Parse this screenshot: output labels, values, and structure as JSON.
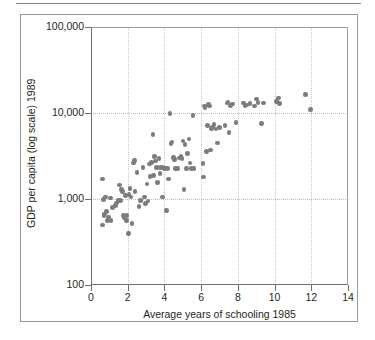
{
  "figure": {
    "outer_border_color": "#9a9a9a",
    "top_rule_color": "#8a8a8a",
    "background": "#ffffff"
  },
  "chart_data": {
    "type": "scatter",
    "title": "",
    "xlabel": "Average years of schooling 1985",
    "ylabel": "GDP per capita (log scale) 1989",
    "xlim": [
      0,
      14
    ],
    "ylim": [
      100,
      100000
    ],
    "yscale": "log",
    "xticks": [
      0,
      2,
      4,
      6,
      8,
      10,
      12,
      14
    ],
    "xticklabels": [
      "0",
      "2",
      "4",
      "6",
      "8",
      "10",
      "12",
      "14"
    ],
    "yticks": [
      100,
      1000,
      10000,
      100000
    ],
    "yticklabels": [
      "100",
      "1,000",
      "10,000",
      "100,000"
    ],
    "grid": true,
    "grid_color": "#bdbdbd",
    "legend": null,
    "marker_color": "#7c7c7c",
    "marker_size_px": 4.6,
    "n_points": 112,
    "points": [
      [
        0.62,
        1700
      ],
      [
        0.68,
        990
      ],
      [
        0.7,
        640
      ],
      [
        0.74,
        670
      ],
      [
        0.62,
        500
      ],
      [
        0.8,
        1060
      ],
      [
        0.86,
        720
      ],
      [
        0.9,
        560
      ],
      [
        0.96,
        620
      ],
      [
        1.05,
        1030
      ],
      [
        1.1,
        560
      ],
      [
        1.16,
        800
      ],
      [
        1.32,
        840
      ],
      [
        1.4,
        900
      ],
      [
        1.5,
        960
      ],
      [
        1.55,
        1460
      ],
      [
        1.6,
        960
      ],
      [
        1.66,
        1280
      ],
      [
        1.72,
        1220
      ],
      [
        1.78,
        640
      ],
      [
        1.82,
        600
      ],
      [
        1.88,
        1100
      ],
      [
        1.92,
        560
      ],
      [
        1.96,
        640
      ],
      [
        2.04,
        400
      ],
      [
        2.06,
        1120
      ],
      [
        2.12,
        1320
      ],
      [
        2.18,
        1060
      ],
      [
        2.24,
        520
      ],
      [
        2.3,
        2620
      ],
      [
        2.36,
        2800
      ],
      [
        2.4,
        1230
      ],
      [
        2.5,
        2020
      ],
      [
        2.62,
        820
      ],
      [
        2.7,
        960
      ],
      [
        2.84,
        2320
      ],
      [
        2.92,
        1060
      ],
      [
        2.96,
        880
      ],
      [
        3.06,
        1500
      ],
      [
        3.1,
        950
      ],
      [
        3.18,
        2560
      ],
      [
        3.22,
        1820
      ],
      [
        3.3,
        2660
      ],
      [
        3.38,
        5600
      ],
      [
        3.42,
        1880
      ],
      [
        3.46,
        3100
      ],
      [
        3.52,
        2780
      ],
      [
        3.58,
        2340
      ],
      [
        3.62,
        1560
      ],
      [
        3.7,
        2960
      ],
      [
        3.76,
        1980
      ],
      [
        3.8,
        2340
      ],
      [
        3.88,
        1060
      ],
      [
        3.92,
        2320
      ],
      [
        4.0,
        2280
      ],
      [
        4.06,
        2300
      ],
      [
        4.1,
        740
      ],
      [
        4.16,
        2250
      ],
      [
        4.22,
        1700
      ],
      [
        4.3,
        9900
      ],
      [
        4.36,
        4400
      ],
      [
        4.42,
        4600
      ],
      [
        4.48,
        3050
      ],
      [
        4.54,
        2900
      ],
      [
        4.6,
        2260
      ],
      [
        4.7,
        2260
      ],
      [
        4.8,
        3000
      ],
      [
        4.9,
        3100
      ],
      [
        4.96,
        2960
      ],
      [
        5.02,
        4700
      ],
      [
        5.06,
        1280
      ],
      [
        5.12,
        4300
      ],
      [
        5.2,
        2260
      ],
      [
        5.26,
        3400
      ],
      [
        5.34,
        5000
      ],
      [
        5.4,
        2620
      ],
      [
        5.46,
        2260
      ],
      [
        5.56,
        9300
      ],
      [
        5.62,
        2260
      ],
      [
        6.1,
        2580
      ],
      [
        6.14,
        1800
      ],
      [
        6.18,
        12000
      ],
      [
        6.22,
        11600
      ],
      [
        6.3,
        3550
      ],
      [
        6.36,
        7200
      ],
      [
        6.4,
        12500
      ],
      [
        6.44,
        12000
      ],
      [
        6.5,
        3700
      ],
      [
        6.56,
        6600
      ],
      [
        6.62,
        6900
      ],
      [
        6.7,
        7400
      ],
      [
        6.8,
        6500
      ],
      [
        6.9,
        4500
      ],
      [
        7.0,
        6800
      ],
      [
        7.3,
        7100
      ],
      [
        7.4,
        13100
      ],
      [
        7.46,
        13400
      ],
      [
        7.52,
        5900
      ],
      [
        7.6,
        12300
      ],
      [
        7.7,
        12700
      ],
      [
        7.9,
        7700
      ],
      [
        8.3,
        13000
      ],
      [
        8.4,
        12200
      ],
      [
        8.5,
        12400
      ],
      [
        8.66,
        12800
      ],
      [
        8.9,
        12100
      ],
      [
        9.0,
        14500
      ],
      [
        9.1,
        13200
      ],
      [
        9.3,
        7600
      ],
      [
        9.4,
        13000
      ],
      [
        10.1,
        13600
      ],
      [
        10.2,
        15000
      ],
      [
        10.26,
        12900
      ],
      [
        11.7,
        16500
      ],
      [
        11.95,
        11000
      ]
    ]
  }
}
